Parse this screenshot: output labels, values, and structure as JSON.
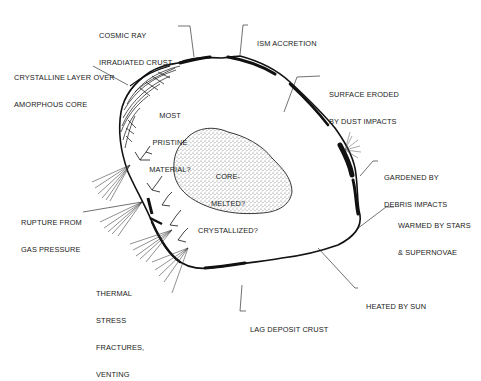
{
  "diagram": {
    "type": "labeled illustration",
    "colors": {
      "ink": "#111111",
      "background": "#ffffff",
      "stipple": "#8a8a8a"
    },
    "labels": {
      "cosmic_ray": {
        "line1": "COSMIC RAY",
        "line2": "IRRADIATED CRUST"
      },
      "ism": {
        "line1": "ISM ACCRETION"
      },
      "crystalline": {
        "line1": "CRYSTALLINE LAYER OVER",
        "line2": "AMORPHOUS CORE"
      },
      "surface_eroded": {
        "line1": "SURFACE ERODED",
        "line2": "BY DUST IMPACTS"
      },
      "most_pristine": {
        "line1": "MOST",
        "line2": "PRISTINE",
        "line3": "MATERIAL?"
      },
      "core": {
        "line1": "CORE-",
        "line2": "MELTED?",
        "line3": "CRYSTALLIZED?"
      },
      "gardened": {
        "line1": "GARDENED BY",
        "line2": "DEBRIS IMPACTS"
      },
      "rupture": {
        "line1": "RUPTURE FROM",
        "line2": "GAS PRESSURE"
      },
      "warmed": {
        "line1": "WARMED BY STARS",
        "line2": "& SUPERNOVAE"
      },
      "thermal": {
        "line1": "THERMAL",
        "line2": "STRESS",
        "line3": "FRACTURES,",
        "line4": "VENTING"
      },
      "heated": {
        "line1": "HEATED BY SUN"
      },
      "lag": {
        "line1": "LAG DEPOSIT CRUST"
      }
    }
  }
}
